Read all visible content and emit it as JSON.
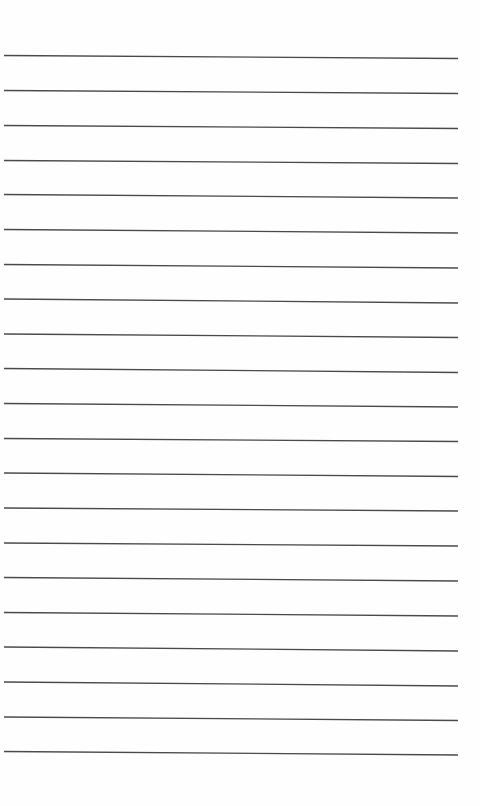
{
  "page": {
    "type": "lined-paper",
    "background_color": "#fefefe",
    "line_color": "#4a4a4a",
    "line_count": 21,
    "line_x_start": 4,
    "line_x_end": 458,
    "lines": [
      {
        "y_left": 55.5,
        "y_right": 58.5
      },
      {
        "y_left": 90.5,
        "y_right": 93.5
      },
      {
        "y_left": 125.5,
        "y_right": 128.5
      },
      {
        "y_left": 160.5,
        "y_right": 163.5
      },
      {
        "y_left": 194.5,
        "y_right": 198
      },
      {
        "y_left": 229.5,
        "y_right": 233
      },
      {
        "y_left": 264.5,
        "y_right": 268
      },
      {
        "y_left": 299,
        "y_right": 303
      },
      {
        "y_left": 334,
        "y_right": 337.5
      },
      {
        "y_left": 368.5,
        "y_right": 372.5
      },
      {
        "y_left": 403.5,
        "y_right": 407
      },
      {
        "y_left": 438.5,
        "y_right": 441.5
      },
      {
        "y_left": 473,
        "y_right": 476.5
      },
      {
        "y_left": 508,
        "y_right": 511
      },
      {
        "y_left": 543,
        "y_right": 546
      },
      {
        "y_left": 577.5,
        "y_right": 581
      },
      {
        "y_left": 612.5,
        "y_right": 616
      },
      {
        "y_left": 647,
        "y_right": 651
      },
      {
        "y_left": 682,
        "y_right": 686
      },
      {
        "y_left": 717,
        "y_right": 720.5
      },
      {
        "y_left": 751.5,
        "y_right": 755
      }
    ]
  }
}
